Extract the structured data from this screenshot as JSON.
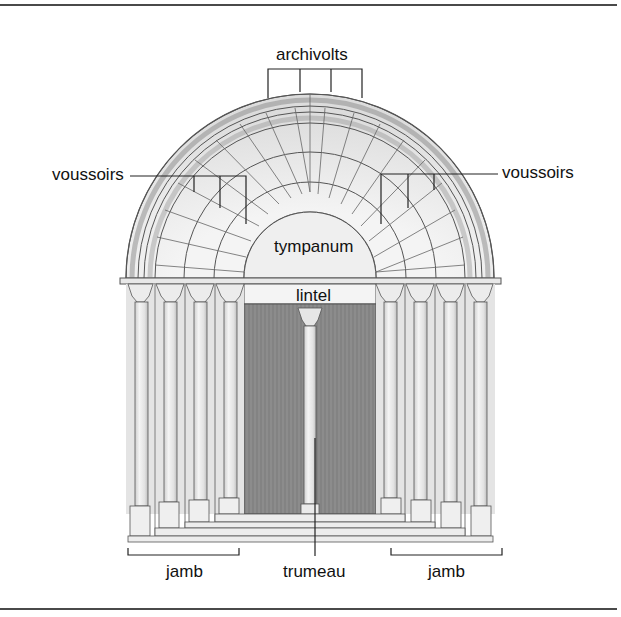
{
  "diagram": {
    "colors": {
      "line": "#4a4a4a",
      "stone": "#ececec",
      "stone_shade": "#d6d6d6",
      "band": "#bdbdbd",
      "door": "#8a8a8a",
      "text": "#111111"
    },
    "labels": {
      "archivolts": "archivolts",
      "voussoirs_left": "voussoirs",
      "voussoirs_right": "voussoirs",
      "tympanum": "tympanum",
      "lintel": "lintel",
      "jamb_left": "jamb",
      "trumeau": "trumeau",
      "jamb_right": "jamb"
    },
    "columns_per_side": 4,
    "archivolt_rings": 4
  }
}
